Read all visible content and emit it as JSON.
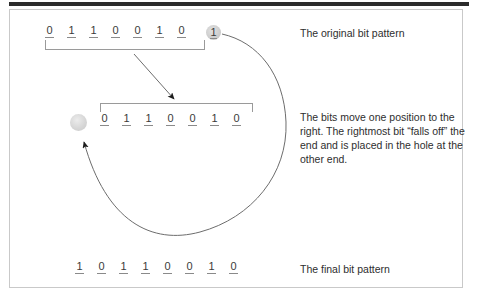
{
  "figure": {
    "rows": {
      "original": {
        "label": "original-bit-row",
        "bits": [
          "0",
          "1",
          "1",
          "0",
          "0",
          "1",
          "0"
        ],
        "carry_bit": "1"
      },
      "shifted": {
        "label": "shifted-bit-row",
        "bits": [
          "0",
          "1",
          "1",
          "0",
          "0",
          "1",
          "0"
        ],
        "hole": ""
      },
      "final": {
        "label": "final-bit-row",
        "bits": [
          "1",
          "0",
          "1",
          "1",
          "0",
          "0",
          "1",
          "0"
        ]
      }
    },
    "captions": {
      "original": "The original bit pattern",
      "shift": "The bits move one position to the right. The rightmost bit “falls off” the end and is placed in the hole at the other end.",
      "final": "The final bit pattern"
    },
    "colors": {
      "rule": "#2b2b2b",
      "border": "#c9c9c9",
      "bit_text": "#3a3a3a",
      "bit_underline": "#8a8a8a",
      "bracket": "#9a9a9a",
      "circle_fill": "#cfcfcf",
      "arrow": "#5a5a5a",
      "caption_text": "#2e2e2e",
      "background": "#ffffff"
    }
  }
}
